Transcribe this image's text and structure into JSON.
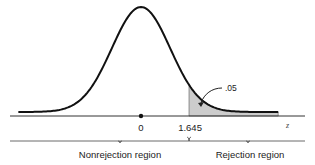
{
  "chart_data": {
    "type": "area",
    "title": "",
    "distribution": "standard normal",
    "xlabel": "z",
    "ylabel": "",
    "xlim": [
      -4.2,
      4.9
    ],
    "grid": false,
    "mean": 0,
    "sd": 1,
    "critical_value": 1.645,
    "tail": "right",
    "tail_area": 0.05,
    "tick_labels": [
      {
        "value": 0,
        "label": "0"
      },
      {
        "value": 1.645,
        "label": "1.645"
      }
    ],
    "annotations": [
      {
        "text": ".05",
        "target": "shaded right tail area"
      }
    ],
    "regions": [
      {
        "name": "Nonrejection region",
        "from": "-inf",
        "to": 1.645
      },
      {
        "name": "Rejection region",
        "from": 1.645,
        "to": "inf"
      }
    ]
  },
  "labels": {
    "axis_z": "z",
    "tick_zero": "0",
    "tick_critical": "1.645",
    "tail_area": ".05",
    "nonrejection": "Nonrejection region",
    "rejection": "Rejection region"
  },
  "colors": {
    "curve": "#111111",
    "shade": "#cccccc",
    "axis": "#333333"
  }
}
